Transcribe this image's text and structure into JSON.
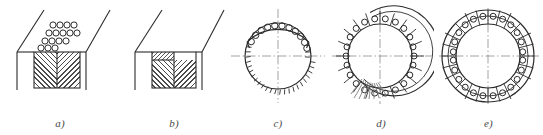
{
  "plate": {
    "background_color": "#ffffff",
    "line_color": "#2b2b2b",
    "centerline_color": "#8a8a8a",
    "caption_color": "#4a4a4a",
    "width": 543,
    "height": 135
  },
  "figures": [
    {
      "id": "a",
      "caption": "a)",
      "type": "hopper-cross-section-with-loose-granules",
      "x": 0,
      "width": 120,
      "granule_rows": [
        4,
        5,
        4,
        3
      ],
      "granule_count": 16,
      "granule_radius": 3.1,
      "block": {
        "x": 34,
        "y": 52,
        "width": 46,
        "height": 36
      },
      "hatch_spacing": 5,
      "hatch_mirrored": true
    },
    {
      "id": "b",
      "caption": "b)",
      "type": "hopper-cross-section-compacted",
      "x": 120,
      "width": 108,
      "block": {
        "x": 32,
        "y": 52,
        "width": 44,
        "height": 36
      },
      "top_band_height": 8,
      "hatch_spacing": 5,
      "hatch_mirrored": true
    },
    {
      "id": "c",
      "caption": "c)",
      "type": "circle-with-partial-ring-of-rollers",
      "x": 228,
      "width": 100,
      "circle": {
        "cx": 50,
        "cy": 56,
        "r": 33
      },
      "band_outer_offset": 11,
      "roller_count": 11,
      "roller_radius": 3.2,
      "roller_arc_start_deg": 200,
      "roller_arc_end_deg": 340,
      "tick_count": 26,
      "tick_arc_start_deg": 10,
      "tick_arc_end_deg": 170,
      "tick_length": 5,
      "centerlines": true
    },
    {
      "id": "d",
      "caption": "d)",
      "type": "annular-cage-partial-with-roots",
      "x": 328,
      "width": 106,
      "circle": {
        "cx": 52,
        "cy": 56,
        "r": 32
      },
      "ring_thickness": 13,
      "roller_count": 22,
      "roller_radius": 3.0,
      "gap_start_deg": 95,
      "gap_end_deg": 120,
      "root_count": 9,
      "centerlines": true
    },
    {
      "id": "e",
      "caption": "e)",
      "type": "annular-cage-complete",
      "x": 434,
      "width": 109,
      "circle": {
        "cx": 54,
        "cy": 56,
        "r": 32
      },
      "ring_thickness": 14,
      "roller_count": 24,
      "roller_radius": 3.0,
      "segment_dividers": 24,
      "centerlines": true
    }
  ]
}
